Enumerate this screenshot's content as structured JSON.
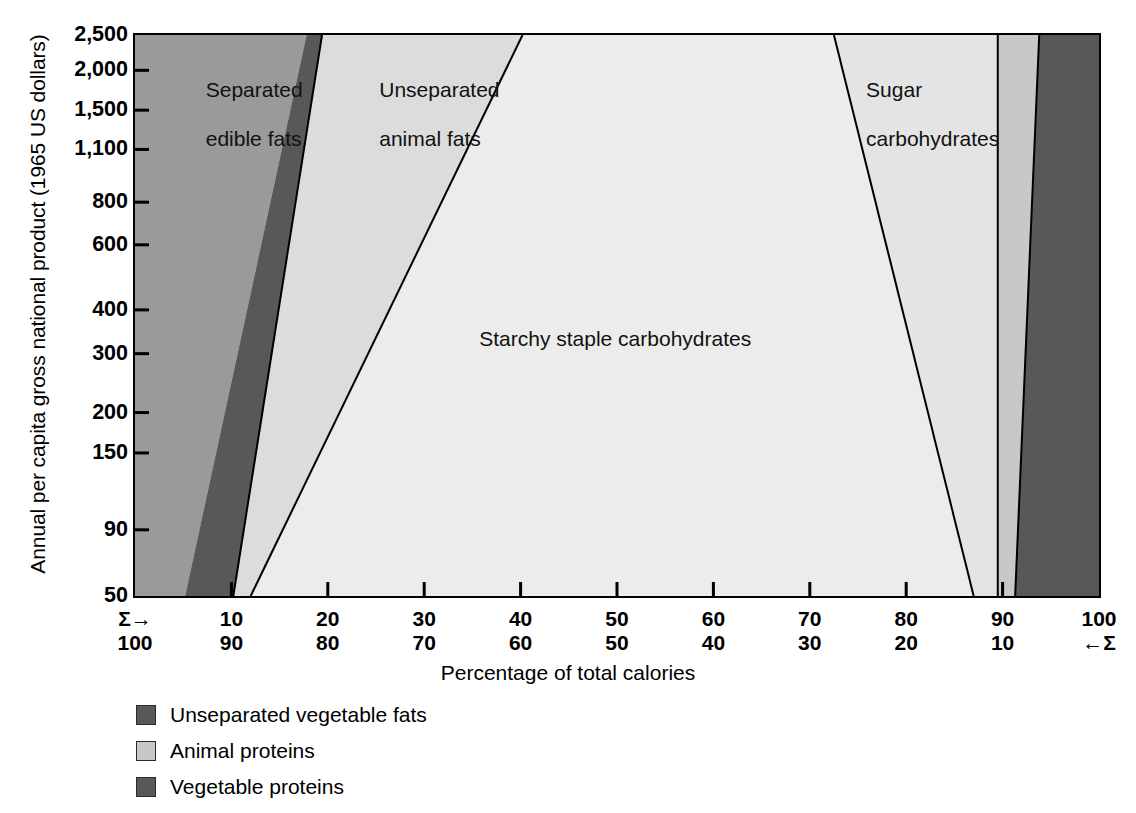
{
  "chart_data": {
    "type": "area",
    "title": "",
    "xlabel": "Percentage of total calories",
    "ylabel": "Annual per capita gross national product (1965 US dollars)",
    "x_axis": {
      "top_ticks": [
        "Σ→",
        "10",
        "20",
        "30",
        "40",
        "50",
        "60",
        "70",
        "80",
        "90",
        "100"
      ],
      "bottom_ticks": [
        "100",
        "90",
        "80",
        "70",
        "60",
        "50",
        "40",
        "30",
        "20",
        "10",
        "←Σ"
      ],
      "range": [
        0,
        100
      ],
      "grid": false
    },
    "y_axis": {
      "ticks": [
        "2,500",
        "2,000",
        "1,500",
        "1,100",
        "800",
        "600",
        "400",
        "300",
        "200",
        "150",
        "90",
        "50"
      ],
      "scale": "log",
      "range": [
        50,
        2500
      ],
      "grid": false
    },
    "legend": {
      "position": "below-plot",
      "entries": [
        {
          "label": "Unseparated vegetable fats",
          "color": "#585858"
        },
        {
          "label": "Animal proteins",
          "color": "#c8c8c8"
        },
        {
          "label": "Vegetable proteins",
          "color": "#585858"
        }
      ]
    },
    "regions": [
      {
        "name": "separated-edible-fats",
        "label": "Separated\nedible fats",
        "color": "#9a9a9a",
        "label_x_pct": 4.5,
        "label_y_px": 22,
        "x_at_top_pct": 0.0,
        "x_at_bottom_pct": 0.0,
        "right_top_pct": 17.8,
        "right_bottom_pct": 5.2
      },
      {
        "name": "unseparated-vegetable-fats",
        "label": "",
        "color": "#585858",
        "left_top_pct": 17.8,
        "left_bottom_pct": 5.2,
        "right_top_pct": 19.4,
        "right_bottom_pct": 10.2
      },
      {
        "name": "unseparated-animal-fats",
        "label": "Unseparated\nanimal fats",
        "color": "#dcdcdc",
        "label_x_pct": 21.5,
        "label_y_px": 22,
        "left_top_pct": 19.4,
        "left_bottom_pct": 10.2,
        "right_top_pct": 40.2,
        "right_bottom_pct": 12.0
      },
      {
        "name": "starchy-staple-carbohydrates",
        "label": "Starchy staple carbohydrates",
        "color": "#ececec",
        "label_x_pct": 36.0,
        "label_y_px": 295,
        "left_top_pct": 40.2,
        "left_bottom_pct": 12.0,
        "right_top_pct": 72.5,
        "right_bottom_pct": 87.0
      },
      {
        "name": "sugar-carbohydrates",
        "label": "Sugar\ncarbohydrates",
        "color": "#e4e4e4",
        "label_x_pct": 74.5,
        "label_y_px": 22,
        "left_top_pct": 72.5,
        "left_bottom_pct": 87.0,
        "right_top_pct": 89.5,
        "right_bottom_pct": 89.5
      },
      {
        "name": "animal-proteins",
        "label": "",
        "color": "#c8c8c8",
        "left_top_pct": 89.5,
        "left_bottom_pct": 89.5,
        "right_top_pct": 93.8,
        "right_bottom_pct": 91.3
      },
      {
        "name": "vegetable-proteins",
        "label": "",
        "color": "#585858",
        "left_top_pct": 93.8,
        "left_bottom_pct": 91.3,
        "right_top_pct": 100.0,
        "right_bottom_pct": 100.0
      }
    ]
  },
  "axis": {
    "y_title": "Annual per capita gross national product (1965 US dollars)",
    "x_title": "Percentage of total calories"
  },
  "y_ticks": [
    {
      "label": "2,500",
      "pos": 0.0
    },
    {
      "label": "2,000",
      "pos": 0.063
    },
    {
      "label": "1,500",
      "pos": 0.134
    },
    {
      "label": "1,100",
      "pos": 0.204
    },
    {
      "label": "800",
      "pos": 0.298
    },
    {
      "label": "600",
      "pos": 0.374
    },
    {
      "label": "400",
      "pos": 0.49
    },
    {
      "label": "300",
      "pos": 0.568
    },
    {
      "label": "200",
      "pos": 0.673
    },
    {
      "label": "150",
      "pos": 0.745
    },
    {
      "label": "90",
      "pos": 0.882
    },
    {
      "label": "50",
      "pos": 1.0
    }
  ],
  "x_ticks": [
    {
      "top": "Σ→",
      "bottom": "100",
      "pos": 0.0
    },
    {
      "top": "10",
      "bottom": "90",
      "pos": 0.1
    },
    {
      "top": "20",
      "bottom": "80",
      "pos": 0.2
    },
    {
      "top": "30",
      "bottom": "70",
      "pos": 0.3
    },
    {
      "top": "40",
      "bottom": "60",
      "pos": 0.4
    },
    {
      "top": "50",
      "bottom": "50",
      "pos": 0.5
    },
    {
      "top": "60",
      "bottom": "40",
      "pos": 0.6
    },
    {
      "top": "70",
      "bottom": "30",
      "pos": 0.7
    },
    {
      "top": "80",
      "bottom": "20",
      "pos": 0.8
    },
    {
      "top": "90",
      "bottom": "10",
      "pos": 0.9
    },
    {
      "top": "100",
      "bottom": "←Σ",
      "pos": 1.0
    }
  ],
  "region_labels": {
    "separated_edible_fats_l1": "Separated",
    "separated_edible_fats_l2": "edible fats",
    "unseparated_animal_fats_l1": "Unseparated",
    "unseparated_animal_fats_l2": "animal fats",
    "sugar_carbohydrates_l1": "Sugar",
    "sugar_carbohydrates_l2": "carbohydrates",
    "starchy_staple": "Starchy staple carbohydrates"
  },
  "legend_items": [
    {
      "label": "Unseparated vegetable fats",
      "color": "#585858"
    },
    {
      "label": "Animal proteins",
      "color": "#c8c8c8"
    },
    {
      "label": "Vegetable proteins",
      "color": "#585858"
    }
  ]
}
